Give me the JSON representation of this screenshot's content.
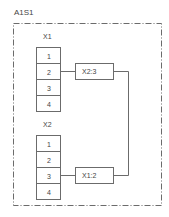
{
  "diagram": {
    "title": "A1S1",
    "frame_style": "dash-dot",
    "colors": {
      "line": "#6b6b6b",
      "text": "#444444",
      "background": "#ffffff"
    },
    "terminal_strips": [
      {
        "label": "X1",
        "terminals": [
          "1",
          "2",
          "3",
          "4"
        ],
        "connection": {
          "terminal": "2",
          "target_ref": "X2:3"
        }
      },
      {
        "label": "X2",
        "terminals": [
          "1",
          "2",
          "3",
          "4"
        ],
        "connection": {
          "terminal": "3",
          "target_ref": "X1:2"
        }
      }
    ],
    "connections": [
      {
        "from": "X1:2",
        "to": "X2:3"
      }
    ]
  }
}
